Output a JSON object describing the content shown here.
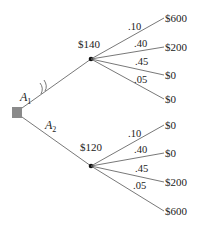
{
  "diagram": {
    "type": "decision-tree",
    "decision_node": {
      "shape": "square",
      "color": "#8a8a8a"
    },
    "alternatives": [
      {
        "name": "A",
        "subscript": "1",
        "pruned": true,
        "expected_value": "$140",
        "outcomes": [
          {
            "probability": ".10",
            "payoff": "$600"
          },
          {
            "probability": ".40",
            "payoff": "$200"
          },
          {
            "probability": ".45",
            "payoff": "$0"
          },
          {
            "probability": ".05",
            "payoff": "$0"
          }
        ]
      },
      {
        "name": "A",
        "subscript": "2",
        "pruned": false,
        "expected_value": "$120",
        "outcomes": [
          {
            "probability": ".10",
            "payoff": "$0"
          },
          {
            "probability": ".40",
            "payoff": "$0"
          },
          {
            "probability": ".45",
            "payoff": "$200"
          },
          {
            "probability": ".05",
            "payoff": "$600"
          }
        ]
      }
    ]
  }
}
